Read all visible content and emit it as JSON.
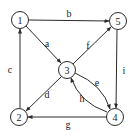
{
  "graph": {
    "type": "directed",
    "nodes": [
      {
        "id": "1",
        "label": "1",
        "x": 20,
        "y": 20
      },
      {
        "id": "5",
        "label": "5",
        "x": 118,
        "y": 21
      },
      {
        "id": "3",
        "label": "3",
        "x": 67,
        "y": 70
      },
      {
        "id": "2",
        "label": "2",
        "x": 19,
        "y": 117
      },
      {
        "id": "4",
        "label": "4",
        "x": 115,
        "y": 117
      }
    ],
    "edges": [
      {
        "id": "a",
        "label": "a",
        "from": "1",
        "to": "3",
        "label_x": 47,
        "label_y": 43
      },
      {
        "id": "b",
        "label": "b",
        "from": "1",
        "to": "5",
        "label_x": 69,
        "label_y": 13
      },
      {
        "id": "c",
        "label": "c",
        "from": "2",
        "to": "1",
        "label_x": 10,
        "label_y": 69
      },
      {
        "id": "d",
        "label": "d",
        "from": "3",
        "to": "2",
        "label_x": 47,
        "label_y": 94
      },
      {
        "id": "e",
        "label": "e",
        "from": "3",
        "to": "4",
        "label_x": 97,
        "label_y": 83,
        "curve": "upper"
      },
      {
        "id": "f",
        "label": "f",
        "from": "3",
        "to": "5",
        "label_x": 88,
        "label_y": 45
      },
      {
        "id": "g",
        "label": "g",
        "from": "4",
        "to": "2",
        "label_x": 68,
        "label_y": 124
      },
      {
        "id": "h",
        "label": "h",
        "from": "4",
        "to": "3",
        "label_x": 82,
        "label_y": 98,
        "curve": "lower"
      },
      {
        "id": "i",
        "label": "i",
        "from": "5",
        "to": "4",
        "label_x": 124,
        "label_y": 70
      }
    ]
  },
  "colors": {
    "stroke": "#2a2a2a",
    "text": "#1a1a1a",
    "background": "#ffffff"
  }
}
